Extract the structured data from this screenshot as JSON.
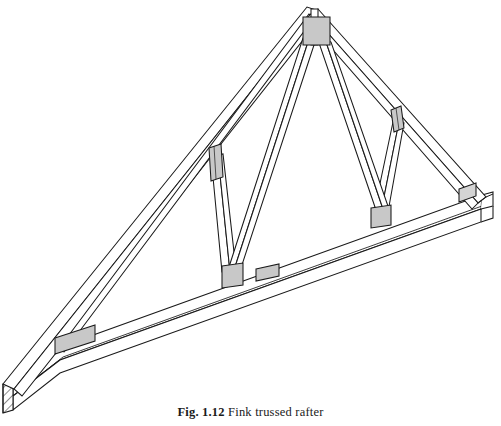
{
  "figure": {
    "label": "Fig. 1.12",
    "title": "Fink trussed rafter",
    "domain": "technical-line-drawing",
    "background_color": "#ffffff",
    "line_color": "#1a1a1a",
    "plate_fill_color": "#c8c8c8",
    "plate_fill_light": "#d4d4d4",
    "member_face_color": "#ffffff",
    "hatch_color": "#303030"
  },
  "drawing": {
    "members": [
      {
        "name": "bottom-tie-beam",
        "description": "Main bottom chord / ceiling tie running from lower-left heel to right-hand eaves"
      },
      {
        "name": "left-rafter",
        "description": "Upper-left principal rafter from heel to apex"
      },
      {
        "name": "right-rafter",
        "description": "Upper-right principal rafter from apex to right eaves"
      },
      {
        "name": "left-web-strut",
        "description": "Inclined web strut on left side from tie beam node to left rafter"
      },
      {
        "name": "left-web-tie",
        "description": "Long web member from left node up to apex"
      },
      {
        "name": "right-web-strut",
        "description": "Inclined web strut on right side from tie beam node to right rafter"
      },
      {
        "name": "right-web-tie",
        "description": "Long web member from right node up to apex"
      },
      {
        "name": "centre-vertical-post",
        "description": "Short vertical member below apex plate"
      }
    ],
    "connector_plates": [
      {
        "name": "apex-plate",
        "shape": "square",
        "location": "apex of truss"
      },
      {
        "name": "left-rafter-node-plate",
        "shape": "narrow-vertical",
        "location": "left rafter web junction"
      },
      {
        "name": "right-rafter-node-plate",
        "shape": "narrow-vertical",
        "location": "right rafter web junction"
      },
      {
        "name": "left-bottom-node-plate",
        "shape": "square",
        "location": "bottom chord left web node"
      },
      {
        "name": "right-bottom-node-plate",
        "shape": "square",
        "location": "bottom chord right web node"
      },
      {
        "name": "bottom-chord-splice-plate",
        "shape": "small-rectangle",
        "location": "bottom chord splice near centre"
      },
      {
        "name": "heel-plate",
        "shape": "long-rectangle",
        "location": "lower-left heel joint"
      },
      {
        "name": "eaves-plate",
        "shape": "small-rectangle",
        "location": "right-hand eaves joint"
      }
    ],
    "end_section": {
      "name": "tie-beam-end-grain",
      "description": "Cross-hatched end grain of the tie beam at lower-left",
      "hatch_pattern": "diagonal-lines"
    }
  }
}
